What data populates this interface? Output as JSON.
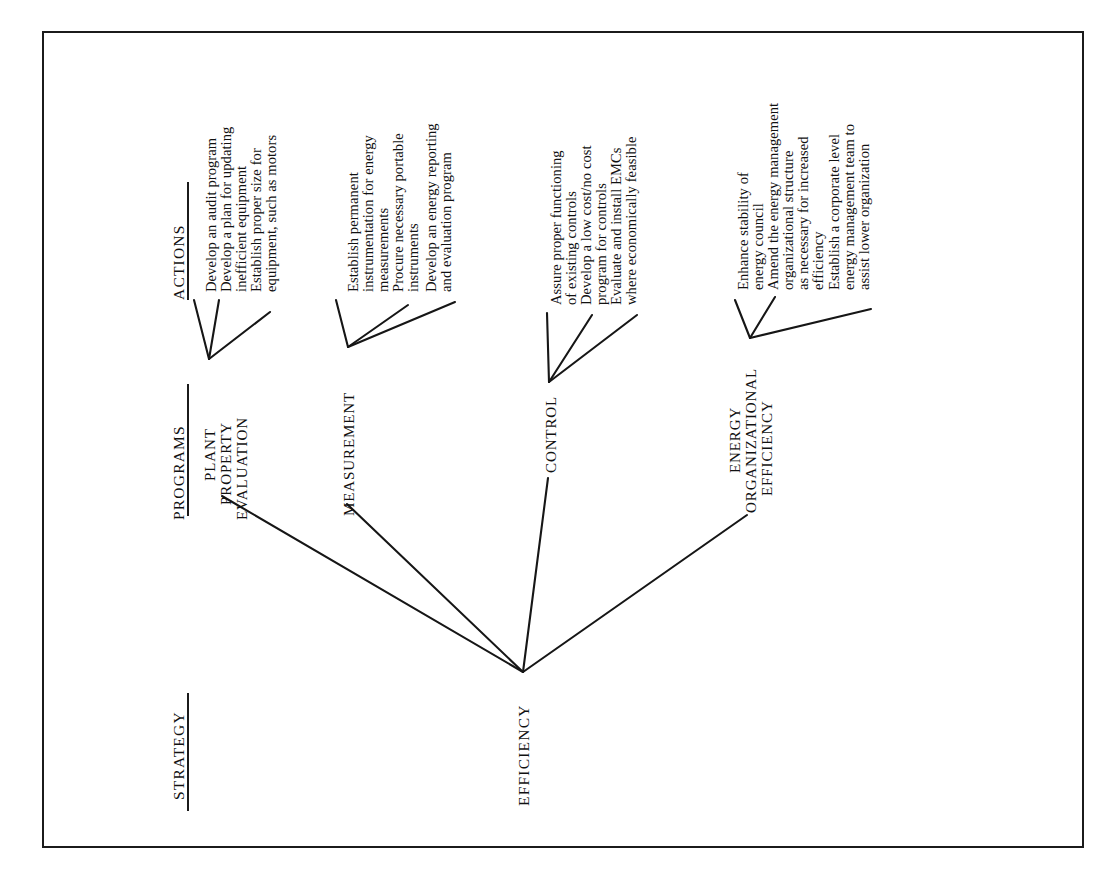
{
  "figure": {
    "orientation": "rotated-90-ccw",
    "ink_color": "#161616",
    "background": "#ffffff"
  },
  "columns": {
    "strategy": {
      "header": "STRATEGY"
    },
    "programs": {
      "header": "PROGRAMS"
    },
    "actions": {
      "header": "ACTIONS"
    }
  },
  "root": {
    "label": "EFFICIENCY"
  },
  "programs": [
    {
      "id": "plant-property-evaluation",
      "label_lines": [
        "PLANT",
        "PROPERTY",
        "EVALUATION"
      ],
      "actions": [
        {
          "lines": [
            "Develop an audit program"
          ]
        },
        {
          "lines": [
            "Develop a plan for updating",
            "inefficient equipment"
          ]
        },
        {
          "lines": [
            "Establish proper size for",
            "equipment, such as motors"
          ]
        }
      ]
    },
    {
      "id": "measurement",
      "label_lines": [
        "MEASUREMENT"
      ],
      "actions": [
        {
          "lines": [
            "Establish permanent",
            "instrumentation for energy",
            "measurements"
          ]
        },
        {
          "lines": [
            "Procure necessary portable",
            "instruments"
          ]
        },
        {
          "lines": [
            "Develop an energy reporting",
            "and evaluation program"
          ]
        }
      ]
    },
    {
      "id": "control",
      "label_lines": [
        "CONTROL"
      ],
      "actions": [
        {
          "lines": [
            "Assure proper functioning",
            "of existing controls"
          ]
        },
        {
          "lines": [
            "Develop a low cost/no cost",
            "program for controls"
          ]
        },
        {
          "lines": [
            "Evaluate and install EMCs",
            "where economically feasible"
          ]
        }
      ]
    },
    {
      "id": "energy-organizational-efficiency",
      "label_lines": [
        "ENERGY",
        "ORGANIZATIONAL",
        "EFFICIENCY"
      ],
      "actions": [
        {
          "lines": [
            "Enhance stability of",
            "energy council"
          ]
        },
        {
          "lines": [
            "Amend the energy management",
            "organizational structure",
            "as necessary for increased",
            "efficiency"
          ]
        },
        {
          "lines": [
            "Establish a corporate level",
            "energy management team to",
            "assist lower organization"
          ]
        }
      ]
    }
  ]
}
